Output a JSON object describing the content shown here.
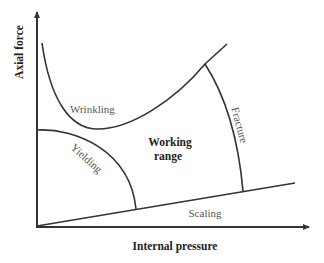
{
  "diagram": {
    "type": "process-window",
    "axes": {
      "x_label": "Internal pressure",
      "y_label": "Axial force"
    },
    "regions": {
      "wrinkling": "Wrinkling",
      "yielding": "Yielding",
      "fracture": "Fracture",
      "scaling": "Scaling",
      "working_range_line1": "Working",
      "working_range_line2": "range"
    },
    "colors": {
      "line": "#333333",
      "label": "#555555",
      "background": "#ffffff"
    }
  }
}
